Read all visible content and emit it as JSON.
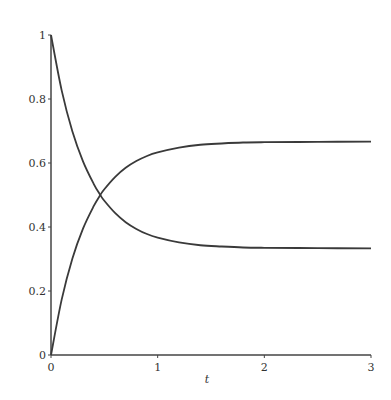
{
  "chart_data": {
    "type": "line",
    "title": "",
    "xlabel": "t",
    "ylabel": "",
    "xlim": [
      0,
      3
    ],
    "ylim": [
      0,
      1
    ],
    "grid": false,
    "legend": null,
    "x_ticks": [
      0,
      1,
      2,
      3
    ],
    "x_tick_labels": [
      "0",
      "1",
      "2",
      "3"
    ],
    "y_ticks": [
      0,
      0.2,
      0.4,
      0.6,
      0.8,
      1
    ],
    "y_tick_labels": [
      "0",
      "0.2",
      "0.4",
      "0.6",
      "0.8",
      "1"
    ],
    "x": [
      0,
      0.1,
      0.2,
      0.3,
      0.4,
      0.462,
      0.5,
      0.6,
      0.7,
      0.8,
      0.9,
      1.0,
      1.2,
      1.4,
      1.6,
      1.8,
      2.0,
      2.5,
      3.0
    ],
    "series": [
      {
        "name": "decreasing (→ 1/3)",
        "values": [
          1.0,
          0.827,
          0.699,
          0.605,
          0.535,
          0.5,
          0.482,
          0.444,
          0.415,
          0.394,
          0.378,
          0.367,
          0.352,
          0.343,
          0.339,
          0.336,
          0.335,
          0.334,
          0.333
        ]
      },
      {
        "name": "increasing (→ 2/3)",
        "values": [
          0.0,
          0.173,
          0.301,
          0.395,
          0.465,
          0.5,
          0.518,
          0.556,
          0.585,
          0.606,
          0.622,
          0.633,
          0.648,
          0.657,
          0.661,
          0.664,
          0.665,
          0.666,
          0.667
        ]
      }
    ],
    "annotations": []
  },
  "style": {
    "line_color": "#3a3a3a",
    "axis_color": "#444444"
  }
}
